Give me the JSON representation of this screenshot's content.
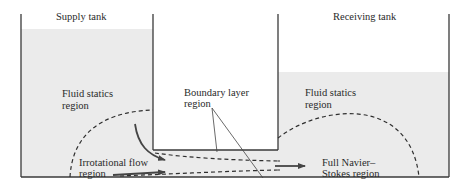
{
  "figure": {
    "labels": {
      "supply_tank": "Supply tank",
      "receiving_tank": "Receiving tank",
      "fluid_statics_left_1": "Fluid statics",
      "fluid_statics_left_2": "region",
      "boundary_layer_1": "Boundary layer",
      "boundary_layer_2": "region",
      "fluid_statics_right_1": "Fluid statics",
      "fluid_statics_right_2": "region",
      "irrotational_1": "Irrotational flow",
      "irrotational_2": "region",
      "navier_stokes_1": "Full Navier–",
      "navier_stokes_2": "Stokes region"
    },
    "colors": {
      "fluid": "#ebebeb",
      "background": "#ffffff",
      "wall": "#3a3a3a",
      "dashed": "#2e2e2e",
      "arrow": "#444444"
    }
  }
}
